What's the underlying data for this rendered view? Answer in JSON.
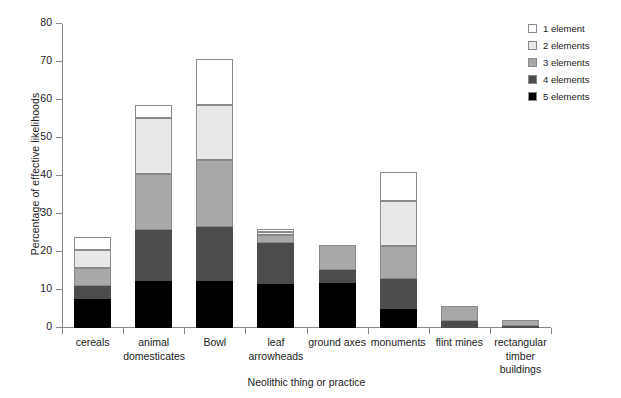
{
  "chart_data": {
    "type": "bar",
    "stacked": true,
    "title": "",
    "xlabel": "Neolithic thing or practice",
    "ylabel": "Percentage of effective likelihoods",
    "ylim": [
      0,
      80
    ],
    "yticks": [
      0,
      10,
      20,
      30,
      40,
      50,
      60,
      70,
      80
    ],
    "grid": false,
    "legend_position": "top-right",
    "categories": [
      "cereals",
      "animal domesticates",
      "Bowl",
      "leaf arrowheads",
      "ground axes",
      "monuments",
      "flint mines",
      "rectangular timber buildings"
    ],
    "category_lines": [
      [
        "cereals"
      ],
      [
        "animal",
        "domesticates"
      ],
      [
        "Bowl"
      ],
      [
        "leaf",
        "arrowheads"
      ],
      [
        "ground axes"
      ],
      [
        "monuments"
      ],
      [
        "flint mines"
      ],
      [
        "rectangular",
        "timber",
        "buildings"
      ]
    ],
    "series": [
      {
        "name": "5 elements",
        "color": "#000000",
        "values": [
          7.6,
          12.3,
          12.3,
          11.5,
          11.8,
          5.0,
          0.0,
          0.0
        ]
      },
      {
        "name": "4 elements",
        "color": "#4c4c4c",
        "values": [
          3.4,
          13.5,
          14.2,
          10.8,
          3.4,
          7.8,
          1.8,
          0.5
        ]
      },
      {
        "name": "3 elements",
        "color": "#a8a8a8",
        "values": [
          4.9,
          14.7,
          17.7,
          2.2,
          6.6,
          8.7,
          4.0,
          1.5
        ]
      },
      {
        "name": "2 elements",
        "color": "#e8e8e8",
        "values": [
          4.7,
          14.8,
          14.5,
          0.7,
          0.0,
          12.0,
          0.0,
          0.0
        ]
      },
      {
        "name": "1 element",
        "color": "#ffffff",
        "values": [
          3.4,
          3.4,
          12.0,
          0.8,
          0.0,
          7.5,
          0.0,
          0.0
        ]
      }
    ],
    "totals": [
      24.0,
      58.7,
      70.7,
      26.0,
      21.8,
      41.0,
      5.8,
      2.0
    ],
    "legend": [
      {
        "label": "1 element",
        "color": "#ffffff"
      },
      {
        "label": "2 elements",
        "color": "#e8e8e8"
      },
      {
        "label": "3 elements",
        "color": "#a8a8a8"
      },
      {
        "label": "4 elements",
        "color": "#4c4c4c"
      },
      {
        "label": "5 elements",
        "color": "#000000"
      }
    ]
  }
}
